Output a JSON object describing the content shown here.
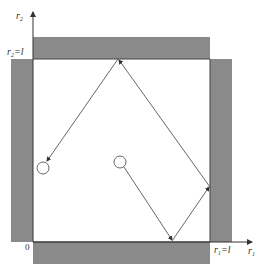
{
  "diagram": {
    "axes": {
      "x_label": "r",
      "x_label_sub": "1",
      "y_label": "r",
      "y_label_sub": "2",
      "origin_label": "0",
      "x_boundary_label": "r",
      "x_boundary_sub": "1",
      "x_boundary_eq": "=l",
      "y_boundary_label": "r",
      "y_boundary_sub": "2",
      "y_boundary_eq": "=l"
    },
    "walls": {
      "color": "#8a8a8a",
      "edge_color": "#555555",
      "items": [
        "top-wall",
        "left-wall",
        "right-wall",
        "bottom-wall"
      ]
    },
    "trajectory": {
      "color": "#555555",
      "points": [
        [
          120,
          163
        ],
        [
          172,
          241
        ],
        [
          210,
          187
        ],
        [
          118,
          59
        ],
        [
          45,
          163
        ]
      ],
      "start_particle": [
        120,
        162
      ],
      "end_particle": [
        43,
        168
      ],
      "particle_radius": 6
    }
  }
}
